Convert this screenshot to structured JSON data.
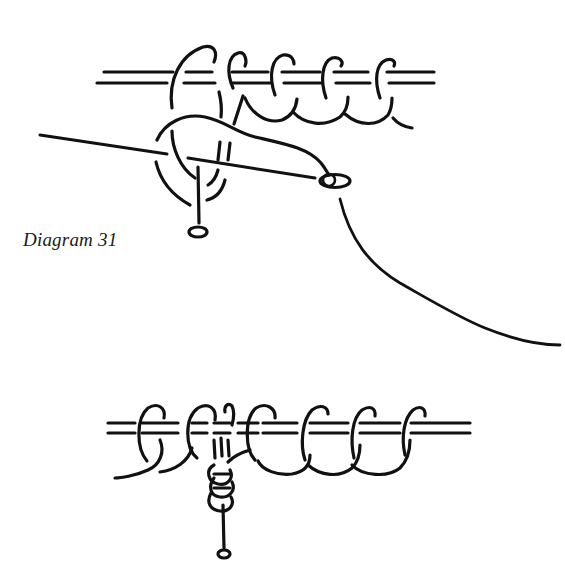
{
  "diagrams": [
    {
      "id": "diagram-31",
      "caption": "Diagram 31",
      "description": "Needle threaded with yarn passing through stitches on a double-strand holder; pin with round head below stitches",
      "stroke_color": "#111111",
      "elements": [
        "double-rail",
        "stitch-loops",
        "needle",
        "needle-eye",
        "yarn-tail",
        "pin"
      ]
    },
    {
      "id": "diagram-32",
      "caption": "Diagram 32",
      "description": "Row of loops on double-strand holder with yarn wrapped around pin below the second loop",
      "stroke_color": "#111111",
      "elements": [
        "double-rail",
        "stitch-loops",
        "wrapped-yarn-coil",
        "pin"
      ]
    }
  ],
  "colors": {
    "background": "#ffffff",
    "ink": "#111111"
  }
}
